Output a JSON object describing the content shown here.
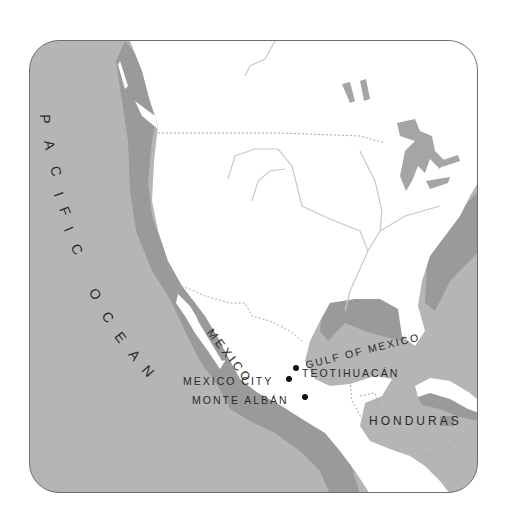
{
  "map": {
    "title": "Mesoamerica region map",
    "colors": {
      "ocean": "#b5b5b5",
      "coast_shadow": "#9a9a9a",
      "land": "#ffffff",
      "river": "#c8c8c8",
      "border": "#a8a8a8",
      "frame_border": "#6e6e6e",
      "text": "#2a2a2a",
      "site_dot": "#111111"
    },
    "water_labels": {
      "pacific_ocean": "PACIFIC OCEAN",
      "pacific_letters": [
        "P",
        "A",
        "C",
        "I",
        "F",
        "I",
        "C",
        "O",
        "C",
        "E",
        "A",
        "N"
      ],
      "gulf_of_mexico": "GULF OF MEXICO"
    },
    "country_labels": {
      "mexico": "MEXICO",
      "honduras": "HONDURAS"
    },
    "sites": [
      {
        "name": "TEOTIHUACÁN",
        "label_side": "right"
      },
      {
        "name": "MEXICO CITY",
        "label_side": "left"
      },
      {
        "name": "MONTE ALBÁN",
        "label_side": "left"
      }
    ]
  }
}
